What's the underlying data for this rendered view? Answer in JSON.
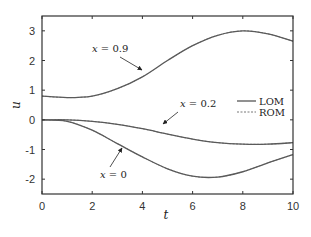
{
  "chart_data": {
    "type": "line",
    "title": "",
    "xlabel": "t",
    "ylabel": "u",
    "xlim": [
      0,
      10
    ],
    "ylim": [
      -2.5,
      3.5
    ],
    "xticks": [
      0,
      2,
      4,
      6,
      8,
      10
    ],
    "yticks": [
      -2,
      -1,
      0,
      1,
      2,
      3
    ],
    "grid": false,
    "legend": {
      "position": "right-middle",
      "entries": [
        {
          "label": "LOM",
          "style": "solid"
        },
        {
          "label": "ROM",
          "style": "dashed"
        }
      ]
    },
    "series": [
      {
        "name": "x = 0.9",
        "x": [
          0,
          1,
          2,
          3,
          4,
          5,
          6,
          7,
          8,
          9,
          10
        ],
        "values": [
          0.8,
          0.75,
          0.8,
          1.05,
          1.45,
          2.0,
          2.5,
          2.85,
          3.0,
          2.9,
          2.65
        ]
      },
      {
        "name": "x = 0.2",
        "x": [
          0,
          1,
          2,
          3,
          4,
          5,
          6,
          7,
          8,
          9,
          10
        ],
        "values": [
          0.0,
          0.0,
          -0.05,
          -0.15,
          -0.3,
          -0.48,
          -0.65,
          -0.77,
          -0.82,
          -0.82,
          -0.77
        ]
      },
      {
        "name": "x = 0",
        "x": [
          0,
          1,
          2,
          3,
          4,
          5,
          6,
          7,
          8,
          9,
          10
        ],
        "values": [
          0.0,
          -0.05,
          -0.35,
          -0.8,
          -1.25,
          -1.65,
          -1.9,
          -1.93,
          -1.75,
          -1.45,
          -1.17
        ]
      }
    ],
    "annotations": [
      {
        "text_var": "x",
        "text_eq": "= 0.9",
        "arrow_to_t": 4.0,
        "arrow_to_u": 1.45
      },
      {
        "text_var": "x",
        "text_eq": "= 0.2",
        "arrow_to_t": 4.8,
        "arrow_to_u": -0.4
      },
      {
        "text_var": "x",
        "text_eq": "= 0",
        "arrow_to_t": 3.3,
        "arrow_to_u": -1.0
      }
    ]
  }
}
